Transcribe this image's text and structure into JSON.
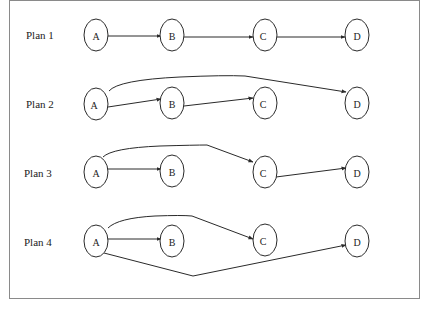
{
  "diagram": {
    "plans": [
      {
        "label": "Plan 1",
        "nodes": [
          {
            "id": "A",
            "label": "A"
          },
          {
            "id": "B",
            "label": "B"
          },
          {
            "id": "C",
            "label": "C"
          },
          {
            "id": "D",
            "label": "D"
          }
        ],
        "edges": [
          {
            "from": "A",
            "to": "B"
          },
          {
            "from": "B",
            "to": "C"
          },
          {
            "from": "C",
            "to": "D"
          }
        ]
      },
      {
        "label": "Plan 2",
        "nodes": [
          {
            "id": "A",
            "label": "A"
          },
          {
            "id": "B",
            "label": "B"
          },
          {
            "id": "C",
            "label": "C"
          },
          {
            "id": "D",
            "label": "D"
          }
        ],
        "edges": [
          {
            "from": "A",
            "to": "B"
          },
          {
            "from": "B",
            "to": "C"
          },
          {
            "from": "A",
            "to": "D"
          }
        ]
      },
      {
        "label": "Plan 3",
        "nodes": [
          {
            "id": "A",
            "label": "A"
          },
          {
            "id": "B",
            "label": "B"
          },
          {
            "id": "C",
            "label": "C"
          },
          {
            "id": "D",
            "label": "D"
          }
        ],
        "edges": [
          {
            "from": "A",
            "to": "B"
          },
          {
            "from": "A",
            "to": "C"
          },
          {
            "from": "C",
            "to": "D"
          }
        ]
      },
      {
        "label": "Plan 4",
        "nodes": [
          {
            "id": "A",
            "label": "A"
          },
          {
            "id": "B",
            "label": "B"
          },
          {
            "id": "C",
            "label": "C"
          },
          {
            "id": "D",
            "label": "D"
          }
        ],
        "edges": [
          {
            "from": "A",
            "to": "B"
          },
          {
            "from": "A",
            "to": "C"
          },
          {
            "from": "A",
            "to": "D"
          }
        ]
      }
    ]
  }
}
